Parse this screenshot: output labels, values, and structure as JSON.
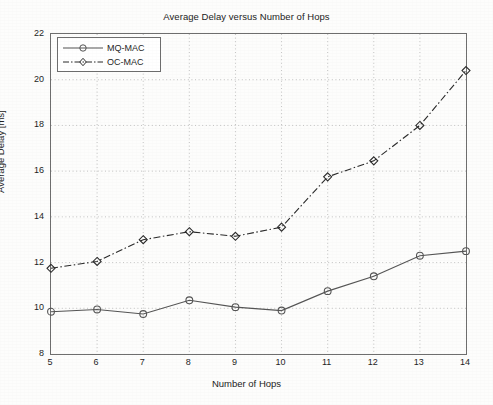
{
  "chart_data": {
    "type": "line",
    "title": "Average Delay versus Number of Hops",
    "xlabel": "Number of Hops",
    "ylabel": "Average Delay [ms]",
    "x": [
      5,
      6,
      7,
      8,
      9,
      10,
      11,
      12,
      13,
      14
    ],
    "categories": [
      "5",
      "6",
      "7",
      "8",
      "9",
      "10",
      "11",
      "12",
      "13",
      "14"
    ],
    "xlim": [
      5,
      14
    ],
    "ylim": [
      8,
      22
    ],
    "xticks": [
      5,
      6,
      7,
      8,
      9,
      10,
      11,
      12,
      13,
      14
    ],
    "xtick_labels": [
      "5",
      "6",
      "7",
      "8",
      "9",
      "10",
      "11",
      "12",
      "13",
      "14"
    ],
    "yticks": [
      8,
      10,
      12,
      14,
      16,
      18,
      20,
      22
    ],
    "ytick_labels": [
      "8",
      "10",
      "12",
      "14",
      "16",
      "18",
      "20",
      "22"
    ],
    "grid": true,
    "grid_style": "dotted",
    "legend_position": "upper left",
    "series": [
      {
        "name": "MQ-MAC",
        "values": [
          9.85,
          9.95,
          9.75,
          10.35,
          10.05,
          9.9,
          10.75,
          11.4,
          12.3,
          12.5
        ],
        "line_style": "solid",
        "marker": "circle",
        "color": "#555555"
      },
      {
        "name": "OC-MAC",
        "values": [
          11.75,
          12.05,
          13.0,
          13.35,
          13.15,
          13.55,
          15.75,
          16.45,
          18.0,
          20.4
        ],
        "line_style": "dash-dot",
        "marker": "diamond",
        "color": "#2b2b2b"
      }
    ],
    "legend": [
      {
        "label": "MQ-MAC",
        "marker": "circle",
        "line_style": "solid"
      },
      {
        "label": "OC-MAC",
        "marker": "diamond",
        "line_style": "dash-dot"
      }
    ]
  }
}
